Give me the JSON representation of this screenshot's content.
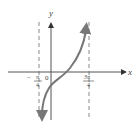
{
  "figure": {
    "type": "function-graph",
    "function_description": "tangent-like curve between vertical asymptotes",
    "axes": {
      "x_label": "x",
      "y_label": "y",
      "origin_label": "0"
    },
    "asymptotes": [
      {
        "x": "-π/4",
        "numerator": "π",
        "denominator": "4",
        "sign": "−"
      },
      {
        "x": "3π/4",
        "numerator": "3π",
        "denominator": "4",
        "sign": ""
      }
    ],
    "colors": {
      "axis": "#555555",
      "curve": "#777777",
      "asymptote": "#777777",
      "text": "#444444"
    }
  }
}
